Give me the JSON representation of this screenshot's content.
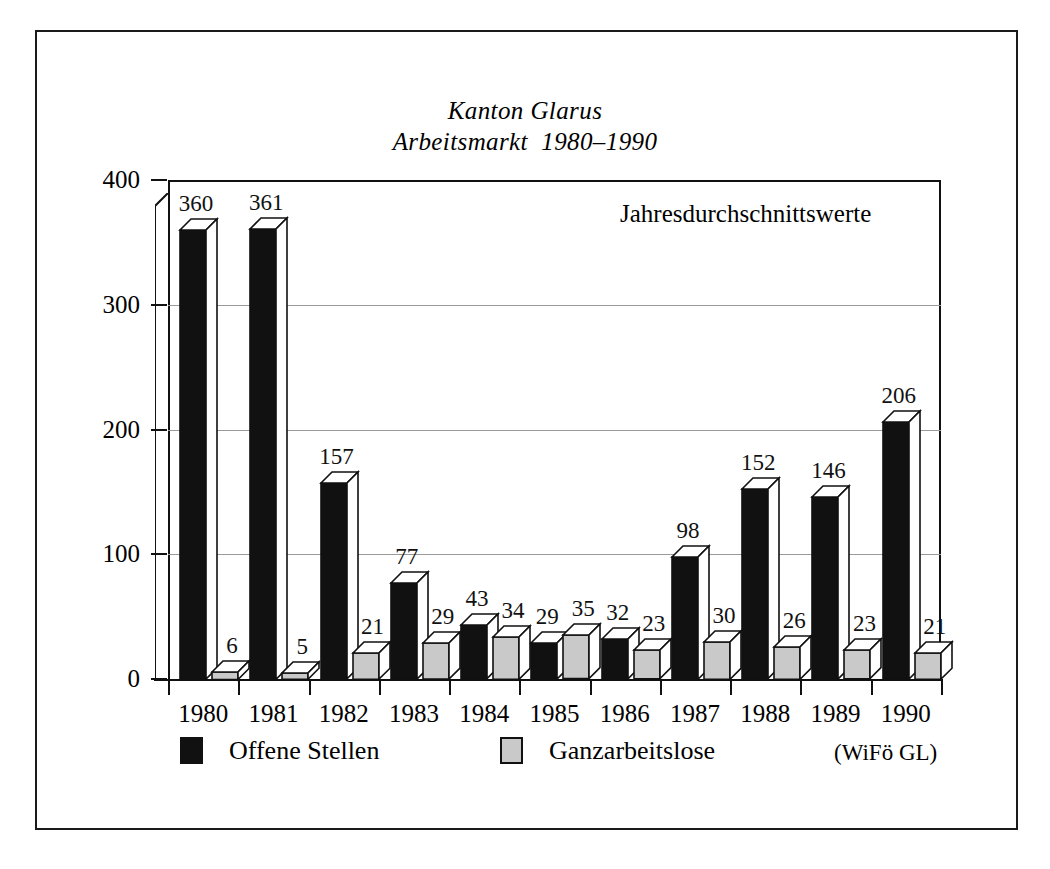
{
  "chart_data": {
    "type": "bar",
    "title": "Kanton Glarus",
    "subtitle": "Arbeitsmarkt  1980–1990",
    "annotation": "Jahresdurchschnittswerte",
    "source": "(WiFö GL)",
    "xlabel": "",
    "ylabel": "",
    "ylim": [
      0,
      400
    ],
    "yticks": [
      0,
      100,
      200,
      300,
      400
    ],
    "ytick_labels": [
      "0",
      "100",
      "200",
      "300",
      "400"
    ],
    "grid": true,
    "gridlines_at": [
      100,
      200,
      300
    ],
    "legend_position": "bottom",
    "categories": [
      "1980",
      "1981",
      "1982",
      "1983",
      "1984",
      "1985",
      "1986",
      "1987",
      "1988",
      "1989",
      "1990"
    ],
    "series": [
      {
        "name": "Offene Stellen",
        "color": "#111111",
        "values": [
          360,
          361,
          157,
          77,
          43,
          29,
          32,
          98,
          152,
          146,
          206
        ],
        "labels": [
          "360",
          "361",
          "157",
          "77",
          "43",
          "29",
          "32",
          "98",
          "152",
          "146",
          "206"
        ]
      },
      {
        "name": "Ganzarbeitslose",
        "color": "#c9c9c9",
        "values": [
          6,
          5,
          21,
          29,
          34,
          35,
          23,
          30,
          26,
          23,
          21
        ],
        "labels": [
          "6",
          "5",
          "21",
          "29",
          "34",
          "35",
          "23",
          "30",
          "26",
          "23",
          "21"
        ]
      }
    ]
  },
  "legend": {
    "items": [
      {
        "label": "Offene Stellen",
        "swatch": "black-square-icon"
      },
      {
        "label": "Ganzarbeitslose",
        "swatch": "grey-square-icon"
      }
    ]
  }
}
